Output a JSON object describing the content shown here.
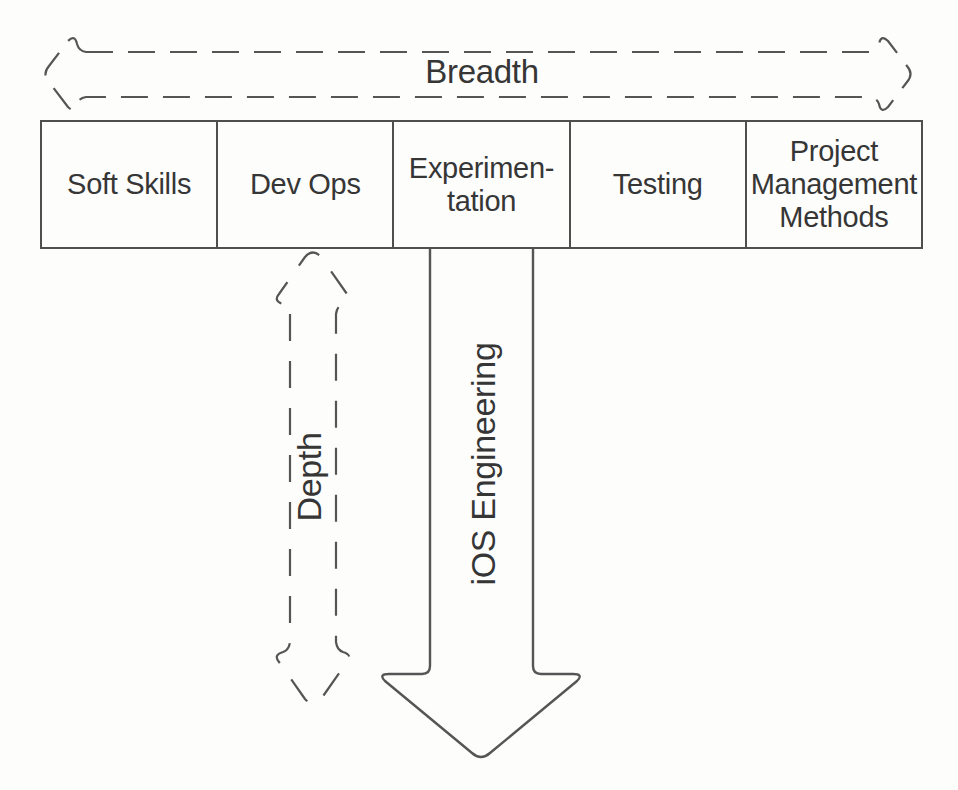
{
  "diagram": {
    "breadth_axis_label": "Breadth",
    "depth_axis_label": "Depth",
    "specialization_arrow_label": "iOS Engineering",
    "breadth_skills": [
      "Soft Skills",
      "Dev Ops",
      "Experimen-\ntation",
      "Testing",
      "Project Management Methods"
    ]
  },
  "colors": {
    "background": "#fdfdfc",
    "line": "#555555",
    "text": "#363636"
  }
}
